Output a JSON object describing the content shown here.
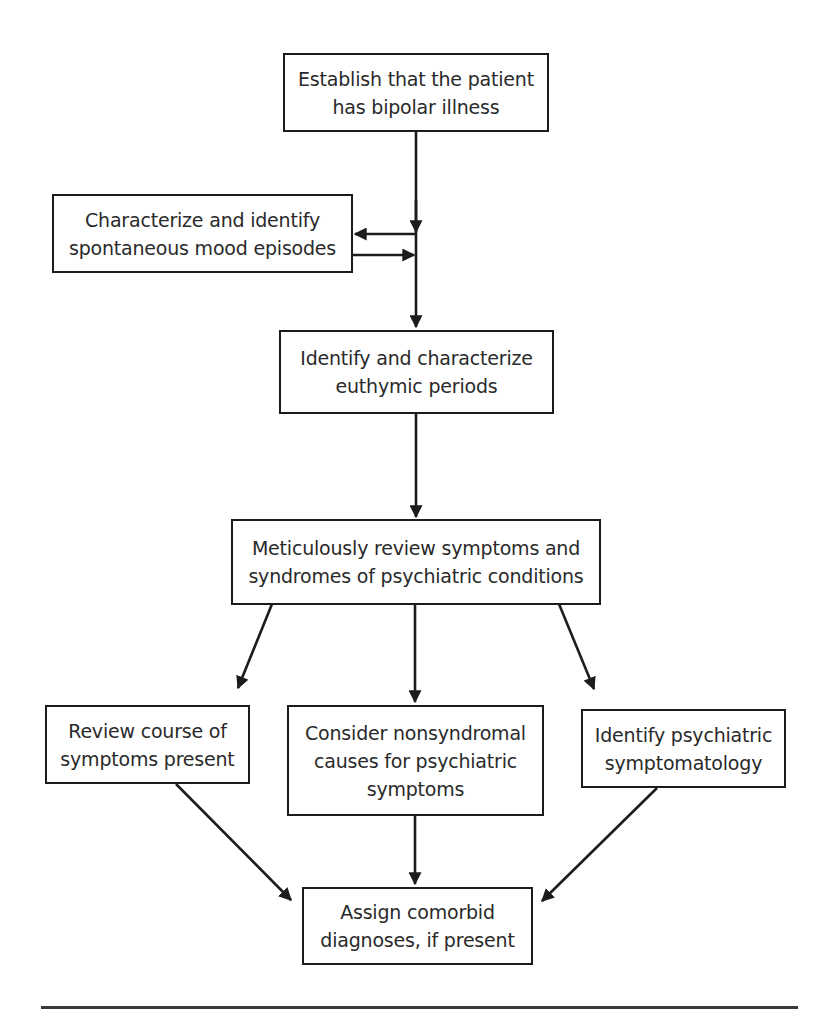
{
  "diagram": {
    "type": "flowchart",
    "nodes": [
      {
        "id": "establish",
        "text": "Establish that the patient has bipolar illness"
      },
      {
        "id": "characterize-episodes",
        "text": "Characterize and identify spontaneous mood episodes"
      },
      {
        "id": "euthymic",
        "text": "Identify and characterize euthymic periods"
      },
      {
        "id": "review-symptoms",
        "text": "Meticulously review symptoms and syndromes of psychiatric conditions"
      },
      {
        "id": "review-course",
        "text": "Review course of symptoms present"
      },
      {
        "id": "nonsyndromal",
        "text": "Consider nonsyndromal causes for psychiatric symptoms"
      },
      {
        "id": "identify-symptomatology",
        "text": "Identify psychiatric symptomatology"
      },
      {
        "id": "assign-comorbid",
        "text": "Assign comorbid diagnoses, if present"
      }
    ],
    "edges": [
      {
        "from": "establish",
        "to": "euthymic"
      },
      {
        "from": "establish",
        "to": "characterize-episodes"
      },
      {
        "from": "characterize-episodes",
        "to": "euthymic"
      },
      {
        "from": "euthymic",
        "to": "review-symptoms"
      },
      {
        "from": "review-symptoms",
        "to": "review-course"
      },
      {
        "from": "review-symptoms",
        "to": "nonsyndromal"
      },
      {
        "from": "review-symptoms",
        "to": "identify-symptomatology"
      },
      {
        "from": "review-course",
        "to": "assign-comorbid"
      },
      {
        "from": "nonsyndromal",
        "to": "assign-comorbid"
      },
      {
        "from": "identify-symptomatology",
        "to": "assign-comorbid"
      }
    ]
  },
  "boxes": {
    "establish": {
      "line1": "Establish that the patient",
      "line2": "has bipolar illness"
    },
    "characterize_episodes": {
      "line1": "Characterize and identify",
      "line2": "spontaneous mood episodes"
    },
    "euthymic": {
      "line1": "Identify and characterize",
      "line2": "euthymic periods"
    },
    "review_symptoms": {
      "line1": "Meticulously review symptoms and",
      "line2": "syndromes of psychiatric conditions"
    },
    "review_course": {
      "line1": "Review course of",
      "line2": "symptoms present"
    },
    "nonsyndromal": {
      "line1": "Consider nonsyndromal",
      "line2": "causes for psychiatric",
      "line3": "symptoms"
    },
    "identify_symptomatology": {
      "line1": "Identify psychiatric",
      "line2": "symptomatology"
    },
    "assign_comorbid": {
      "line1": "Assign comorbid",
      "line2": "diagnoses, if present"
    }
  }
}
